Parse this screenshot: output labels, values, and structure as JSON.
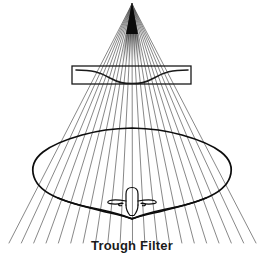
{
  "figure": {
    "caption": "Trough Filter",
    "background_color": "#ffffff",
    "line_color": "#1a1a1a",
    "width": 264,
    "height": 255
  },
  "source": {
    "label": "x-ray-source-apex",
    "x": 132,
    "y": 3,
    "color": "#111111"
  },
  "beam": {
    "label": "x-ray-beam-fan",
    "ray_count": 21,
    "ray_color": "#555555",
    "ray_width": 0.7,
    "apex_x": 132,
    "apex_y": 4,
    "bottom_y": 243,
    "bottom_left_x": 9,
    "bottom_right_x": 256
  },
  "filter": {
    "label": "Trough Filter",
    "rect": {
      "x": 72,
      "y": 66,
      "width": 119,
      "height": 18
    },
    "rect_stroke": "#1a1a1a",
    "rect_stroke_width": 1.3,
    "curve_stroke": "#1a1a1a",
    "curve_stroke_width": 1.6,
    "trough_depth_px": 13,
    "trough_center_x": 132
  },
  "anatomy": {
    "label": "body-cross-section",
    "outline_stroke": "#0d0d0d",
    "outline_stroke_width": 1.7,
    "bounds": {
      "left": 33,
      "right": 232,
      "top": 128,
      "bottom": 219
    },
    "vertebra": {
      "label": "vertebra",
      "stroke": "#0d0d0d",
      "stroke_width": 1.2,
      "center_x": 132,
      "top_y": 187,
      "bottom_y": 215
    }
  }
}
